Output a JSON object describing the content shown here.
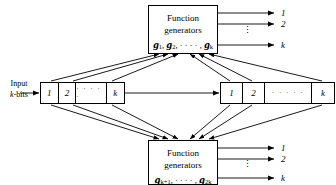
{
  "figure": {
    "background_color": "#ffffff",
    "line_color": "#000000"
  },
  "input": {
    "line1": "Input",
    "line2_italic": "k",
    "line2_rest": "-bits"
  },
  "registers": [
    {
      "name": "left-register",
      "cells": [
        {
          "label": "1",
          "kind": "index"
        },
        {
          "label": "2",
          "kind": "index"
        },
        {
          "label": "· · · · ·",
          "kind": "ellipsis"
        },
        {
          "label": "k",
          "kind": "index"
        }
      ]
    },
    {
      "name": "right-register",
      "cells": [
        {
          "label": "1",
          "kind": "index"
        },
        {
          "label": "2",
          "kind": "index"
        },
        {
          "label": "· · · · ·",
          "kind": "ellipsis"
        },
        {
          "label": "k",
          "kind": "index"
        }
      ]
    }
  ],
  "function_generator_boxes": [
    {
      "name": "top-function-generators",
      "line1": "Function",
      "line2": "generators",
      "generators_prefix": "g",
      "generators_text": "g1, g2, · · · · , gk",
      "generators_parts": [
        {
          "sym": "g",
          "sub": "1",
          "sep": ", "
        },
        {
          "sym": "g",
          "sub": "2",
          "sep": ", · · · · , "
        },
        {
          "sym": "g",
          "sub": "k",
          "sep": ""
        }
      ],
      "outputs": [
        {
          "label": "1"
        },
        {
          "label": "2"
        },
        {
          "label": "k"
        }
      ],
      "output_ellipsis": "⋮"
    },
    {
      "name": "bottom-function-generators",
      "line1": "Function",
      "line2": "generators",
      "generators_prefix": "g",
      "generators_text": "gk+1, · · · · , g2k",
      "generators_parts": [
        {
          "sym": "g",
          "sub": "k+1",
          "sep": ", · · · · , "
        },
        {
          "sym": "g",
          "sub": "2k",
          "sep": ""
        }
      ],
      "outputs": [
        {
          "label": "1"
        },
        {
          "label": "2"
        },
        {
          "label": "k"
        }
      ],
      "output_ellipsis": "⋮"
    }
  ]
}
